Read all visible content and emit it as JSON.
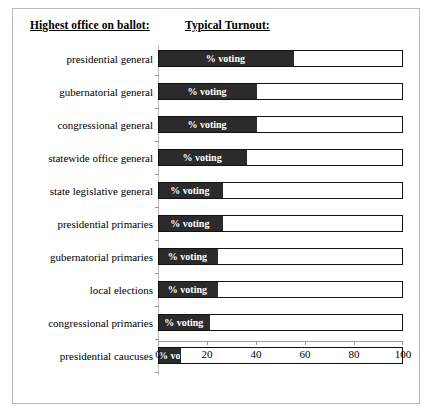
{
  "header": {
    "left_title": "Highest office on ballot:",
    "right_title": "Typical Turnout:"
  },
  "chart_data": {
    "type": "bar",
    "orientation": "horizontal",
    "title": "Typical Turnout:",
    "xlabel": "",
    "ylabel": "Highest office on ballot:",
    "xlim": [
      0,
      100
    ],
    "xticks": [
      0,
      20,
      40,
      60,
      80,
      100
    ],
    "grid": false,
    "legend": "none",
    "bar_label": "% voting",
    "bar_fill_color": "#2b2b2b",
    "bar_outline_color": "#111111",
    "bar_track_color": "#ffffff",
    "categories": [
      "presidential general",
      "gubernatorial general",
      "congressional general",
      "statewide office general",
      "state legislative general",
      "presidential primaries",
      "gubernatorial primaries",
      "local elections",
      "congressional primaries",
      "presidential caucuses"
    ],
    "values": [
      55,
      40,
      40,
      36,
      26,
      26,
      24,
      24,
      21,
      9
    ],
    "series": [
      {
        "name": "% voting",
        "values": [
          55,
          40,
          40,
          36,
          26,
          26,
          24,
          24,
          21,
          9
        ]
      }
    ]
  }
}
